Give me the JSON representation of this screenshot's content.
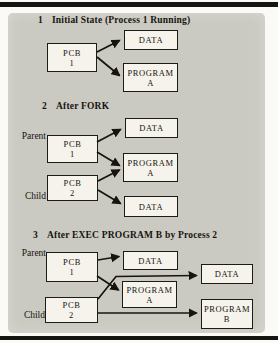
{
  "figure": {
    "colors": {
      "panel_bg": "#cbcac2",
      "box_bg": "#f5f3ec",
      "line": "#17140f",
      "frame_bar": "#151413"
    },
    "sections": [
      {
        "number": "1",
        "title": "Initial State (Process 1 Running)"
      },
      {
        "number": "2",
        "title": "After FORK"
      },
      {
        "number": "3",
        "title": "After EXEC PROGRAM B by Process 2"
      }
    ],
    "side_labels": {
      "parent": "Parent",
      "child": "Child"
    },
    "boxes": {
      "s1_pcb1": {
        "line1": "PCB",
        "line2": "1"
      },
      "s1_data": {
        "line1": "DATA"
      },
      "s1_prog_a": {
        "line1": "PROGRAM",
        "line2": "A"
      },
      "s2_data_parent": {
        "line1": "DATA"
      },
      "s2_pcb1": {
        "line1": "PCB",
        "line2": "1"
      },
      "s2_prog_a": {
        "line1": "PROGRAM",
        "line2": "A"
      },
      "s2_pcb2": {
        "line1": "PCB",
        "line2": "2"
      },
      "s2_data_child": {
        "line1": "DATA"
      },
      "s3_pcb1": {
        "line1": "PCB",
        "line2": "1"
      },
      "s3_data_parent": {
        "line1": "DATA"
      },
      "s3_prog_a": {
        "line1": "PROGRAM",
        "line2": "A"
      },
      "s3_data_child": {
        "line1": "DATA"
      },
      "s3_pcb2": {
        "line1": "PCB",
        "line2": "2"
      },
      "s3_prog_b": {
        "line1": "PROGRAM",
        "line2": "B"
      }
    },
    "edges": [
      {
        "section": "1",
        "from": "PCB 1",
        "to": "DATA"
      },
      {
        "section": "1",
        "from": "PCB 1",
        "to": "PROGRAM A"
      },
      {
        "section": "2",
        "from": "PCB 1 (Parent)",
        "to": "DATA"
      },
      {
        "section": "2",
        "from": "PCB 1 (Parent)",
        "to": "PROGRAM A"
      },
      {
        "section": "2",
        "from": "PCB 2 (Child)",
        "to": "PROGRAM A"
      },
      {
        "section": "2",
        "from": "PCB 2 (Child)",
        "to": "DATA"
      },
      {
        "section": "3",
        "from": "PCB 1 (Parent)",
        "to": "DATA"
      },
      {
        "section": "3",
        "from": "PCB 1 (Parent)",
        "to": "PROGRAM A"
      },
      {
        "section": "3",
        "from": "PCB 2 (Child)",
        "to": "DATA (new)"
      },
      {
        "section": "3",
        "from": "PCB 2 (Child)",
        "to": "PROGRAM B"
      }
    ]
  }
}
